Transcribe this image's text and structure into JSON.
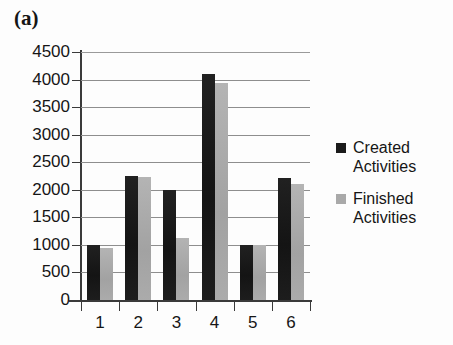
{
  "figure": {
    "panel_label": "(a)"
  },
  "legend": {
    "position": "right",
    "entries": [
      {
        "label_line1": "Created",
        "label_line2": "Activities",
        "color": "#1b1b1b",
        "swatch_name": "legend-swatch-created"
      },
      {
        "label_line1": "Finished",
        "label_line2": "Activities",
        "color": "#a9a9a9",
        "swatch_name": "legend-swatch-finished"
      }
    ]
  },
  "axes": {
    "y_ticks": [
      "4500",
      "4000",
      "3500",
      "3000",
      "2500",
      "2000",
      "1500",
      "1000",
      "500",
      "0"
    ],
    "x_ticks": [
      "1",
      "2",
      "3",
      "4",
      "5",
      "6"
    ]
  },
  "chart_data": {
    "type": "bar",
    "title": "(a)",
    "xlabel": "",
    "ylabel": "",
    "categories": [
      "1",
      "2",
      "3",
      "4",
      "5",
      "6"
    ],
    "series": [
      {
        "name": "Created Activities",
        "color": "#1b1b1b",
        "values": [
          1000,
          2250,
          2000,
          4100,
          1000,
          2220
        ]
      },
      {
        "name": "Finished Activities",
        "color": "#a9a9a9",
        "values": [
          950,
          2240,
          1130,
          3930,
          1000,
          2110
        ]
      }
    ],
    "ylim": [
      0,
      4500
    ],
    "ytick_step": 500,
    "grid": true,
    "grid_axis": "y",
    "legend_position": "right"
  }
}
